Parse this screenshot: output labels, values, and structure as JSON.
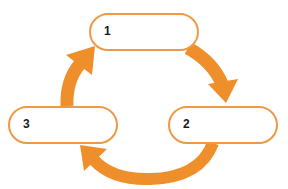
{
  "diagram": {
    "type": "cycle",
    "accent_color": "#EE9A45",
    "arrow_color": "#EF8F2B",
    "nodes": [
      {
        "id": "1",
        "label": "1"
      },
      {
        "id": "2",
        "label": "2"
      },
      {
        "id": "3",
        "label": "3"
      }
    ],
    "edges": [
      {
        "from": "1",
        "to": "2"
      },
      {
        "from": "2",
        "to": "3"
      },
      {
        "from": "3",
        "to": "1"
      }
    ]
  }
}
